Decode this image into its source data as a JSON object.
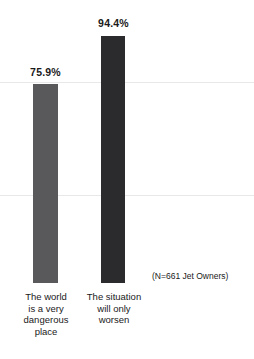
{
  "chart_data": {
    "type": "bar",
    "title": "",
    "subtitle": "",
    "xlabel": "",
    "ylabel": "",
    "ylim": [
      0,
      100
    ],
    "grid": true,
    "legend": false,
    "legend_position": "none",
    "categories": [
      "The world\nis a very\ndangerous\nplace",
      "The situation\nwill only\nworsen"
    ],
    "values": [
      75.9,
      94.4
    ],
    "value_labels": [
      "75.9%",
      "94.4%"
    ],
    "bar_colors": [
      "#59595b",
      "#2b2b2d"
    ],
    "gridline_values": [
      94.4,
      75.9
    ],
    "annotations": [
      {
        "name": "sample-size",
        "text": "(N=661 Jet Owners)"
      }
    ]
  },
  "colors": {
    "background": "#ffffff",
    "text": "#1a1a1a",
    "gridline": "#e8e8e8",
    "bar_light": "#59595b",
    "bar_dark": "#2b2b2d"
  }
}
